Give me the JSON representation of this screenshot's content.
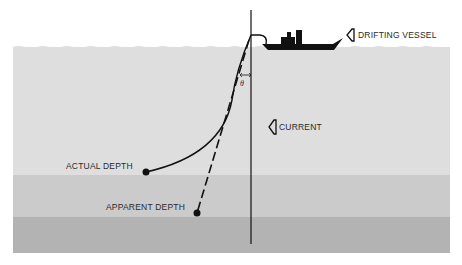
{
  "diagram": {
    "labels": {
      "vessel": "DRIFTING VESSEL",
      "current": "CURRENT",
      "actual_depth": "ACTUAL DEPTH",
      "apparent_depth": "APPARENT DEPTH",
      "angle": "θ"
    },
    "icons": {
      "vessel_arrow": "arrow-left-outline-icon",
      "current_arrow": "arrow-left-outline-icon",
      "ship": "ship-icon"
    },
    "colors": {
      "background": "#ffffff",
      "water_top": "#dedede",
      "water_middle": "#cbcbcb",
      "water_bottom": "#b3b3b3",
      "ink": "#111111"
    }
  }
}
